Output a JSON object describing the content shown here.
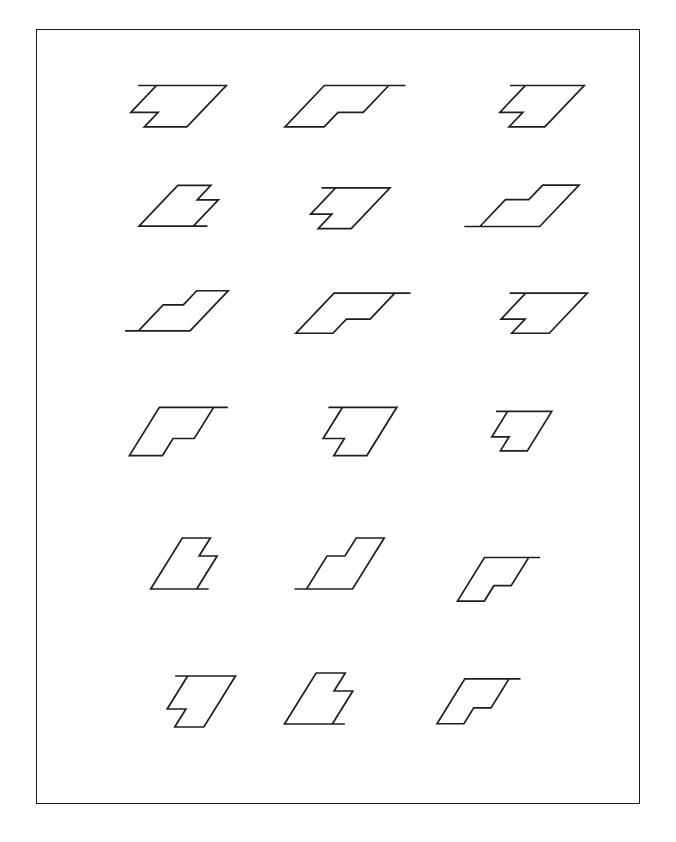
{
  "page": {
    "background_color": "#ffffff",
    "width": 676,
    "height": 842
  },
  "frame": {
    "name": "outer-border",
    "stroke_color": "#1b1b1b",
    "stroke_width": 1.6,
    "x": 36,
    "y": 29,
    "width": 604,
    "height": 775
  },
  "style": {
    "stroke_color": "#1f1f1f",
    "stroke_width": 1.7,
    "fill": "none"
  },
  "chart_data": {
    "type": "diagram",
    "xlabel": "",
    "ylabel": "",
    "grid": false,
    "legend": null,
    "layout": {
      "rows": 6,
      "columns": 3,
      "total_items": 18
    },
    "glyph_outline": [
      [
        0,
        0
      ],
      [
        58,
        0
      ],
      [
        58,
        34
      ],
      [
        30,
        34
      ],
      [
        30,
        22
      ],
      [
        12,
        22
      ],
      [
        12,
        0
      ]
    ],
    "glyph_note": "Each item is an outline letter 'P'/'F' form rendered as a flat skewed figure; the shear and reflection differ per cell.",
    "items": [
      {
        "id": "r1c1",
        "row": 1,
        "col": 1,
        "cx": 163,
        "cy": 105,
        "shear_x": -0.95,
        "scale_x": 1.52,
        "scale_y": 1.22,
        "flip_x": 1,
        "rotation_deg": 0,
        "label": "item-1"
      },
      {
        "id": "r1c2",
        "row": 1,
        "col": 2,
        "cx": 347,
        "cy": 105,
        "shear_x": -0.95,
        "scale_x": 1.4,
        "scale_y": 1.22,
        "flip_x": -1,
        "rotation_deg": 0,
        "label": "item-2"
      },
      {
        "id": "r1c3",
        "row": 1,
        "col": 3,
        "cx": 528,
        "cy": 105,
        "shear_x": -0.95,
        "scale_x": 1.28,
        "scale_y": 1.22,
        "flip_x": 1,
        "rotation_deg": 0,
        "label": "item-3"
      },
      {
        "id": "r2c1",
        "row": 2,
        "col": 1,
        "cx": 192,
        "cy": 207,
        "shear_x": -0.95,
        "scale_x": 1.18,
        "scale_y": 1.2,
        "flip_x": 1,
        "rotation_deg": 180,
        "label": "item-4"
      },
      {
        "id": "r2c2",
        "row": 2,
        "col": 2,
        "cx": 337,
        "cy": 207,
        "shear_x": -0.95,
        "scale_x": 1.18,
        "scale_y": 1.2,
        "flip_x": 1,
        "rotation_deg": 0,
        "label": "item-5"
      },
      {
        "id": "r2c3",
        "row": 2,
        "col": 3,
        "cx": 520,
        "cy": 207,
        "shear_x": -0.95,
        "scale_x": 1.3,
        "scale_y": 1.22,
        "flip_x": -1,
        "rotation_deg": 180,
        "label": "item-6"
      },
      {
        "id": "r3c1",
        "row": 3,
        "col": 1,
        "cx": 175,
        "cy": 312,
        "shear_x": -0.95,
        "scale_x": 1.12,
        "scale_y": 1.18,
        "flip_x": -1,
        "rotation_deg": 180,
        "label": "item-7"
      },
      {
        "id": "r3c2",
        "row": 3,
        "col": 2,
        "cx": 355,
        "cy": 312,
        "shear_x": -0.95,
        "scale_x": 1.32,
        "scale_y": 1.18,
        "flip_x": -1,
        "rotation_deg": 0,
        "label": "item-8"
      },
      {
        "id": "r3c3",
        "row": 3,
        "col": 3,
        "cx": 530,
        "cy": 312,
        "shear_x": -0.95,
        "scale_x": 1.34,
        "scale_y": 1.18,
        "flip_x": 1,
        "rotation_deg": 0,
        "label": "item-9"
      },
      {
        "id": "r4c1",
        "row": 4,
        "col": 1,
        "cx": 180,
        "cy": 430,
        "shear_x": -0.62,
        "scale_x": 1.18,
        "scale_y": 1.42,
        "flip_x": -1,
        "rotation_deg": 0,
        "label": "item-10"
      },
      {
        "id": "r4c2",
        "row": 4,
        "col": 2,
        "cx": 348,
        "cy": 430,
        "shear_x": -0.62,
        "scale_x": 1.18,
        "scale_y": 1.42,
        "flip_x": 1,
        "rotation_deg": 0,
        "label": "item-11"
      },
      {
        "id": "r4c3",
        "row": 4,
        "col": 3,
        "cx": 512,
        "cy": 430,
        "shear_x": -0.62,
        "scale_x": 0.96,
        "scale_y": 1.16,
        "flip_x": 1,
        "rotation_deg": 0,
        "label": "item-12"
      },
      {
        "id": "r5c1",
        "row": 5,
        "col": 1,
        "cx": 195,
        "cy": 565,
        "shear_x": -0.62,
        "scale_x": 1.0,
        "scale_y": 1.5,
        "flip_x": 1,
        "rotation_deg": 180,
        "label": "item-13"
      },
      {
        "id": "r5c2",
        "row": 5,
        "col": 2,
        "cx": 338,
        "cy": 565,
        "shear_x": -0.62,
        "scale_x": 1.0,
        "scale_y": 1.5,
        "flip_x": -1,
        "rotation_deg": 180,
        "label": "item-14"
      },
      {
        "id": "r5c3",
        "row": 5,
        "col": 3,
        "cx": 500,
        "cy": 578,
        "shear_x": -0.62,
        "scale_x": 0.96,
        "scale_y": 1.28,
        "flip_x": -1,
        "rotation_deg": 0,
        "label": "item-15"
      },
      {
        "id": "r6c1",
        "row": 6,
        "col": 1,
        "cx": 190,
        "cy": 700,
        "shear_x": -0.62,
        "scale_x": 1.04,
        "scale_y": 1.5,
        "flip_x": 1,
        "rotation_deg": 0,
        "label": "item-16"
      },
      {
        "id": "r6c2",
        "row": 6,
        "col": 2,
        "cx": 330,
        "cy": 700,
        "shear_x": -0.62,
        "scale_x": 1.04,
        "scale_y": 1.5,
        "flip_x": 1,
        "rotation_deg": 180,
        "label": "item-17"
      },
      {
        "id": "r6c3",
        "row": 6,
        "col": 3,
        "cx": 480,
        "cy": 700,
        "shear_x": -0.62,
        "scale_x": 0.96,
        "scale_y": 1.32,
        "flip_x": -1,
        "rotation_deg": 0,
        "label": "item-18"
      }
    ]
  }
}
